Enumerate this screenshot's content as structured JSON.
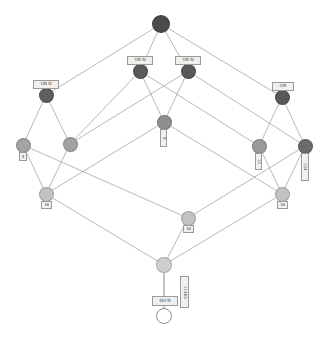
{
  "diagram": {
    "type": "lattice-hasse-diagram",
    "title": "",
    "background": "#ffffff",
    "edge_color": "#9a9a9a",
    "palette": {
      "darkest": "#4a4a4a",
      "dark": "#6e6e6e",
      "mid": "#8f8f8f",
      "light": "#aeaeae",
      "lighter": "#c2c2c2",
      "lightest": "#d4d4d4",
      "ring_fill": "#ffffff",
      "ring_stroke": "#8d8d8d",
      "label_fill": "#f0f0f0",
      "label_stroke": "#9a9a9a",
      "label_text": "#4a4a4a"
    },
    "nodes": [
      {
        "id": "n0",
        "x": 161,
        "y": 24,
        "r": 9,
        "color": "#4a4a4a",
        "label": null
      },
      {
        "id": "n1",
        "x": 140,
        "y": 71,
        "r": 7.5,
        "color": "#595959",
        "label": "or_n1"
      },
      {
        "id": "n2",
        "x": 188,
        "y": 71,
        "r": 7.5,
        "color": "#595959",
        "label": "or_n2"
      },
      {
        "id": "n3",
        "x": 46,
        "y": 95,
        "r": 7.5,
        "color": "#5e5e5e",
        "label": "or_n3"
      },
      {
        "id": "n4",
        "x": 282,
        "y": 97,
        "r": 7.5,
        "color": "#585858",
        "label": "or_n4"
      },
      {
        "id": "n5",
        "x": 164,
        "y": 122,
        "r": 7.5,
        "color": "#8f8f8f",
        "label": "lbl_n5"
      },
      {
        "id": "n6",
        "x": 23,
        "y": 145,
        "r": 7.5,
        "color": "#a3a3a3",
        "label": "lbl_n6"
      },
      {
        "id": "n7",
        "x": 70,
        "y": 144,
        "r": 7.5,
        "color": "#a3a3a3",
        "label": null
      },
      {
        "id": "n8",
        "x": 259,
        "y": 146,
        "r": 7.5,
        "color": "#9a9a9a",
        "label": "lbl_n8"
      },
      {
        "id": "n9",
        "x": 305,
        "y": 146,
        "r": 7.5,
        "color": "#6b6b6b",
        "label": "lbl_n9"
      },
      {
        "id": "n10",
        "x": 46,
        "y": 194,
        "r": 7.5,
        "color": "#c2c2c2",
        "label": "lbl_n10"
      },
      {
        "id": "n11",
        "x": 282,
        "y": 194,
        "r": 7.5,
        "color": "#c2c2c2",
        "label": "lbl_n11"
      },
      {
        "id": "n12",
        "x": 188,
        "y": 218,
        "r": 7.5,
        "color": "#c2c2c2",
        "label": "lbl_n12"
      },
      {
        "id": "n13",
        "x": 164,
        "y": 265,
        "r": 8,
        "color": "#cfcfcf",
        "label": null
      },
      {
        "id": "n14",
        "x": 164,
        "y": 316,
        "r": 8,
        "color": "ring",
        "label": null
      }
    ],
    "edges": [
      [
        "n0",
        "n1"
      ],
      [
        "n0",
        "n2"
      ],
      [
        "n0",
        "n3"
      ],
      [
        "n0",
        "n4"
      ],
      [
        "n1",
        "n5"
      ],
      [
        "n1",
        "n7"
      ],
      [
        "n1",
        "n8"
      ],
      [
        "n2",
        "n5"
      ],
      [
        "n2",
        "n7"
      ],
      [
        "n2",
        "n9"
      ],
      [
        "n3",
        "n6"
      ],
      [
        "n3",
        "n7"
      ],
      [
        "n4",
        "n8"
      ],
      [
        "n4",
        "n9"
      ],
      [
        "n5",
        "n10"
      ],
      [
        "n5",
        "n11"
      ],
      [
        "n6",
        "n10"
      ],
      [
        "n7",
        "n10"
      ],
      [
        "n8",
        "n11"
      ],
      [
        "n9",
        "n11"
      ],
      [
        "n9",
        "n12"
      ],
      [
        "n6",
        "n12"
      ],
      [
        "n10",
        "n13"
      ],
      [
        "n11",
        "n13"
      ],
      [
        "n12",
        "n13"
      ],
      [
        "n13",
        "n14"
      ]
    ],
    "labels": {
      "or_n1": {
        "text": "OR N",
        "x": 127,
        "y": 56,
        "w": 26,
        "h": 9,
        "vertical": false
      },
      "or_n2": {
        "text": "OR N",
        "x": 175,
        "y": 56,
        "w": 26,
        "h": 9,
        "vertical": false
      },
      "or_n3": {
        "text": "OR N",
        "x": 33,
        "y": 80,
        "w": 26,
        "h": 9,
        "vertical": false
      },
      "or_n4": {
        "text": "OR",
        "x": 272,
        "y": 82,
        "w": 22,
        "h": 9,
        "vertical": false
      },
      "lbl_n5": {
        "text": "8",
        "x": 160,
        "y": 129,
        "w": 7,
        "h": 18,
        "vertical": true
      },
      "lbl_n6": {
        "text": "4",
        "x": 19,
        "y": 152,
        "w": 8,
        "h": 9,
        "vertical": false
      },
      "lbl_n8": {
        "text": "12",
        "x": 255,
        "y": 153,
        "w": 7,
        "h": 17,
        "vertical": true
      },
      "lbl_n9": {
        "text": "124",
        "x": 301,
        "y": 153,
        "w": 8,
        "h": 28,
        "vertical": true
      },
      "lbl_n10": {
        "text": "16",
        "x": 41,
        "y": 201,
        "w": 11,
        "h": 8,
        "vertical": false
      },
      "lbl_n11": {
        "text": "16",
        "x": 277,
        "y": 201,
        "w": 11,
        "h": 8,
        "vertical": false
      },
      "lbl_n12": {
        "text": "16",
        "x": 183,
        "y": 225,
        "w": 11,
        "h": 8,
        "vertical": false
      },
      "bottom_gate": {
        "text": "GO N",
        "x": 152,
        "y": 296,
        "w": 26,
        "h": 10,
        "vertical": false
      },
      "bottom_side": {
        "text": "11465",
        "x": 180,
        "y": 276,
        "w": 9,
        "h": 32,
        "vertical": true
      }
    }
  }
}
